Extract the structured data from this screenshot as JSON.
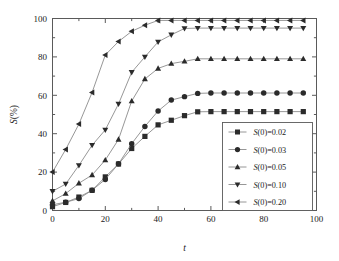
{
  "chart_data": {
    "type": "line",
    "title": "",
    "xlabel": "t",
    "ylabel": "S(%)",
    "xlim": [
      0,
      100
    ],
    "ylim": [
      0,
      100
    ],
    "xticks": [
      0,
      20,
      40,
      60,
      80,
      100
    ],
    "yticks": [
      0,
      20,
      40,
      60,
      80,
      100
    ],
    "xtick_labels": [
      "0",
      "20",
      "40",
      "60",
      "80",
      "100"
    ],
    "ytick_labels": [
      "0",
      "20",
      "40",
      "60",
      "80",
      "100"
    ],
    "grid": false,
    "legend_position": "lower right",
    "x": [
      0,
      5,
      10,
      15,
      20,
      25,
      30,
      35,
      40,
      45,
      50,
      55,
      60,
      65,
      70,
      75,
      80,
      85,
      90,
      95
    ],
    "series": [
      {
        "name": "S(0)=0.02",
        "marker": "square",
        "values": [
          2.0,
          4.2,
          7.0,
          10.5,
          17.5,
          24.2,
          32.3,
          38.6,
          44.6,
          47.0,
          49.4,
          51.4,
          51.5,
          51.5,
          51.5,
          51.5,
          51.5,
          51.5,
          51.5,
          51.5
        ]
      },
      {
        "name": "S(0)=0.03",
        "marker": "circle",
        "values": [
          3.0,
          4.3,
          6.2,
          10.6,
          16.2,
          24.3,
          34.8,
          43.8,
          51.8,
          57.5,
          59.3,
          61.0,
          61.2,
          61.2,
          61.2,
          61.2,
          61.2,
          61.2,
          61.2,
          61.2
        ]
      },
      {
        "name": "S(0)=0.05",
        "marker": "triangle-up",
        "values": [
          5.0,
          8.8,
          14.2,
          18.5,
          26.3,
          37.0,
          57.0,
          68.5,
          74.0,
          76.5,
          77.7,
          79.0,
          79.0,
          79.0,
          79.0,
          79.0,
          79.0,
          79.0,
          79.0,
          79.0
        ]
      },
      {
        "name": "S(0)=0.10",
        "marker": "triangle-down",
        "values": [
          10.0,
          13.8,
          23.5,
          34.0,
          42.0,
          55.5,
          72.0,
          80.0,
          87.8,
          91.5,
          94.8,
          95.0,
          95.0,
          95.0,
          95.0,
          95.0,
          95.0,
          95.0,
          95.0,
          95.0
        ]
      },
      {
        "name": "S(0)=0.20",
        "marker": "triangle-left",
        "values": [
          20.0,
          31.8,
          45.0,
          61.5,
          81.0,
          88.0,
          93.3,
          96.5,
          99.0,
          99.0,
          99.0,
          99.0,
          99.0,
          99.0,
          99.0,
          99.0,
          99.0,
          99.0,
          99.0,
          99.0
        ]
      }
    ],
    "colors": {
      "line": "#8b8b8b",
      "marker": "#2b2b2b",
      "axis": "#5a5a5a",
      "background": "#ffffff"
    }
  },
  "legend": {
    "entries": [
      {
        "prefix": "S",
        "middle": "(0)=",
        "value": "0.02"
      },
      {
        "prefix": "S",
        "middle": "(0)=",
        "value": "0.03"
      },
      {
        "prefix": "S",
        "middle": "(0)=",
        "value": "0.05"
      },
      {
        "prefix": "S",
        "middle": "(0)=",
        "value": "0.10"
      },
      {
        "prefix": "S",
        "middle": "(0)=",
        "value": "0.20"
      }
    ]
  },
  "axes": {
    "x_title": "t",
    "y_title_prefix": "S",
    "y_title_suffix": "(%)"
  }
}
